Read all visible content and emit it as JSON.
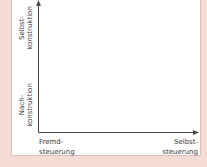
{
  "diagram": {
    "y_axis": {
      "top_label": [
        "Selbst-",
        "konstruktion"
      ],
      "bottom_label": [
        "Nach-",
        "konstruktion"
      ]
    },
    "x_axis": {
      "left_label": [
        "Fremd-",
        "steuerung"
      ],
      "right_label": [
        "Selbst-",
        "steuerung"
      ]
    },
    "colors": {
      "background": "#f3dcd6",
      "panel": "#ffffff",
      "axis": "#4a4a4a",
      "text": "#3a3a3a"
    }
  }
}
